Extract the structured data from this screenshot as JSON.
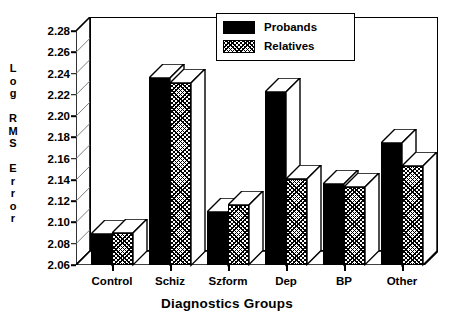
{
  "chart_data": {
    "type": "bar",
    "title": "",
    "xlabel": "Diagnostics Groups",
    "ylabel": "Log RMS Error",
    "categories": [
      "Control",
      "Schiz",
      "Szform",
      "Dep",
      "BP",
      "Other"
    ],
    "series": [
      {
        "name": "Probands",
        "values": [
          2.089,
          2.2355,
          2.11,
          2.2225,
          2.136,
          2.175
        ],
        "color": "#000000",
        "fill": "solid-black"
      },
      {
        "name": "Relatives",
        "values": [
          2.09,
          2.2315,
          2.116,
          2.1405,
          2.133,
          2.153
        ],
        "color": "#000000",
        "fill": "crosshatch"
      }
    ],
    "ylim": [
      2.06,
      2.28
    ],
    "ytick_step": 0.02,
    "ytick_labels": [
      "2.28",
      "2.26",
      "2.24",
      "2.22",
      "2.20",
      "2.18",
      "2.16",
      "2.14",
      "2.12",
      "2.10",
      "2.08",
      "2.06"
    ],
    "grid": true,
    "legend_position": "top-right",
    "style": "3d-column"
  },
  "ylabel_lines": [
    "L",
    "o",
    "g",
    "",
    "R",
    "M",
    "S",
    "",
    "E",
    "r",
    "r",
    "o",
    "r"
  ],
  "legend": {
    "items": [
      {
        "label": "Probands",
        "swatch": "solid-black-swatch"
      },
      {
        "label": "Relatives",
        "swatch": "crosshatch-swatch"
      }
    ]
  },
  "axes": {
    "x_title": "Diagnostics Groups",
    "x_labels": [
      "Control",
      "Schiz",
      "Szform",
      "Dep",
      "BP",
      "Other"
    ],
    "y_labels": [
      "2.28",
      "2.26",
      "2.24",
      "2.22",
      "2.20",
      "2.18",
      "2.16",
      "2.14",
      "2.12",
      "2.10",
      "2.08",
      "2.06"
    ]
  }
}
